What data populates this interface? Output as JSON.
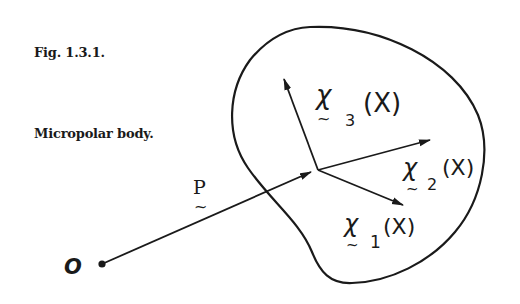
{
  "caption": {
    "figure_number": "Fig. 1.3.1.",
    "description": "Micropolar body."
  },
  "diagram": {
    "origin_label": "O",
    "position_vector_label": "P",
    "director_labels": [
      {
        "symbol": "χ",
        "index": "1",
        "argument": "(X)"
      },
      {
        "symbol": "χ",
        "index": "2",
        "argument": "(X)"
      },
      {
        "symbol": "χ",
        "index": "3",
        "argument": "(X)"
      }
    ],
    "tilde_mark": "~",
    "colors": {
      "ink": "#1a1a1a",
      "background": "#ffffff"
    }
  }
}
